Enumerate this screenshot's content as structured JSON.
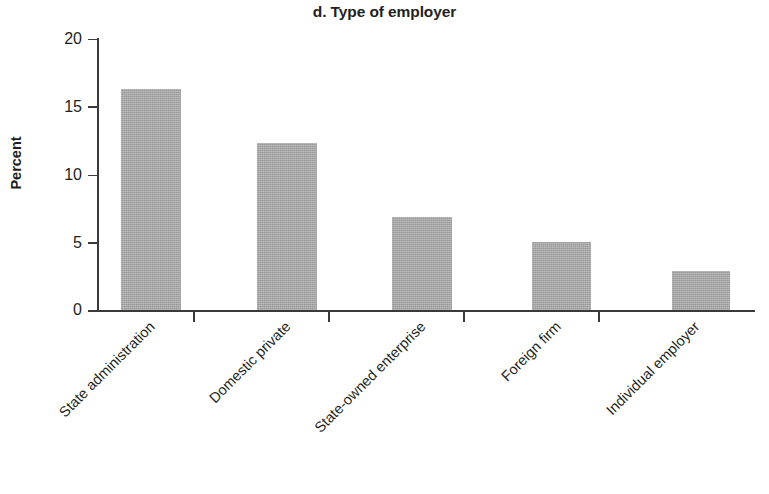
{
  "chart_data": {
    "type": "bar",
    "title": "d. Type of employer",
    "xlabel": "",
    "ylabel": "Percent",
    "categories": [
      "State administration",
      "Domestic private",
      "State-owned enterprise",
      "Foreign firm",
      "Individual employer"
    ],
    "values": [
      16.3,
      12.3,
      6.9,
      5.0,
      2.9
    ],
    "ylim": [
      0,
      20
    ],
    "yticks": [
      0,
      5,
      10,
      15,
      20
    ],
    "ytick_labels": [
      "0",
      "5",
      "10",
      "15",
      "20"
    ],
    "grid": false,
    "legend": false,
    "bar_color": "#a3a3a3",
    "axis_color": "#3a3a3a",
    "text_color": "#231f20",
    "label_rotation_deg": 45
  },
  "axis": {
    "y_label": "Percent",
    "tick_0": "0",
    "tick_1": "5",
    "tick_2": "10",
    "tick_3": "15",
    "tick_4": "20"
  },
  "categories": {
    "c0": "State administration",
    "c1": "Domestic private",
    "c2": "State-owned enterprise",
    "c3": "Foreign firm",
    "c4": "Individual employer"
  },
  "title": {
    "text": "d. Type of employer"
  }
}
